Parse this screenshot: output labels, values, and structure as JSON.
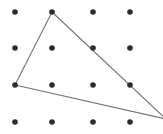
{
  "figure": {
    "width": 163,
    "height": 134,
    "background_color": "#ffffff"
  },
  "chart_data": {
    "type": "scatter",
    "subtitle": "",
    "xlabel": "",
    "ylabel": "",
    "xlim": [
      0,
      163
    ],
    "ylim": [
      134,
      0
    ],
    "grid": false,
    "legend": null,
    "axis_visible": false,
    "tick_labels_x": [],
    "tick_labels_y": [],
    "annotations": [],
    "lattice": {
      "name": "dot-grid",
      "columns": 4,
      "rows": 4,
      "column_x": [
        15,
        52,
        93,
        130
      ],
      "row_y": [
        12,
        48,
        85,
        122
      ],
      "dot_radius": 2.8,
      "dot_color": "#2b2b2b"
    },
    "points": [
      {
        "id": "r1c1",
        "x": 15,
        "y": 12,
        "row": 1,
        "col": 1,
        "on_shape": false
      },
      {
        "id": "r1c2",
        "x": 52,
        "y": 12,
        "row": 1,
        "col": 2,
        "on_shape": true
      },
      {
        "id": "r1c3",
        "x": 93,
        "y": 12,
        "row": 1,
        "col": 3,
        "on_shape": false
      },
      {
        "id": "r1c4",
        "x": 130,
        "y": 12,
        "row": 1,
        "col": 4,
        "on_shape": false
      },
      {
        "id": "r2c1",
        "x": 15,
        "y": 48,
        "row": 2,
        "col": 1,
        "on_shape": false
      },
      {
        "id": "r2c2",
        "x": 52,
        "y": 48,
        "row": 2,
        "col": 2,
        "on_shape": false
      },
      {
        "id": "r2c3",
        "x": 93,
        "y": 48,
        "row": 2,
        "col": 3,
        "on_shape": true
      },
      {
        "id": "r2c4",
        "x": 130,
        "y": 48,
        "row": 2,
        "col": 4,
        "on_shape": false
      },
      {
        "id": "r3c1",
        "x": 15,
        "y": 85,
        "row": 3,
        "col": 1,
        "on_shape": true
      },
      {
        "id": "r3c2",
        "x": 52,
        "y": 85,
        "row": 3,
        "col": 2,
        "on_shape": false
      },
      {
        "id": "r3c3",
        "x": 93,
        "y": 85,
        "row": 3,
        "col": 3,
        "on_shape": false
      },
      {
        "id": "r3c4",
        "x": 130,
        "y": 85,
        "row": 3,
        "col": 4,
        "on_shape": true
      },
      {
        "id": "r4c1",
        "x": 15,
        "y": 122,
        "row": 4,
        "col": 1,
        "on_shape": false
      },
      {
        "id": "r4c2",
        "x": 52,
        "y": 122,
        "row": 4,
        "col": 2,
        "on_shape": false
      },
      {
        "id": "r4c3",
        "x": 93,
        "y": 122,
        "row": 4,
        "col": 3,
        "on_shape": false
      },
      {
        "id": "r4c4",
        "x": 130,
        "y": 122,
        "row": 4,
        "col": 4,
        "on_shape": false
      }
    ],
    "shapes": [
      {
        "id": "triangle",
        "name": "triangle",
        "kind": "polygon",
        "closed": true,
        "stroke_color": "#737373",
        "stroke_width": 1.1,
        "fill": "none",
        "vertices": [
          {
            "label": "apex",
            "x": 52,
            "y": 12,
            "lattice_point": "r1c2",
            "visible": true
          },
          {
            "label": "right",
            "x": 166,
            "y": 119,
            "lattice_point": null,
            "visible": false
          },
          {
            "label": "left",
            "x": 15,
            "y": 85,
            "lattice_point": "r3c1",
            "visible": true
          }
        ],
        "edges": [
          {
            "id": "edge-apex-left",
            "from": "apex",
            "to": "left",
            "passes_through": []
          },
          {
            "id": "edge-apex-right",
            "from": "apex",
            "to": "right",
            "passes_through": [
              "r2c3",
              "r3c4"
            ]
          },
          {
            "id": "edge-left-right",
            "from": "left",
            "to": "right",
            "passes_through": []
          }
        ],
        "path_d": "M 52 12 L 166 119 L 15 85 Z"
      }
    ]
  }
}
